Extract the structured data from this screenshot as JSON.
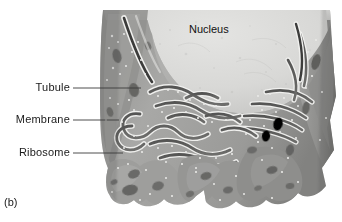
{
  "figure": {
    "caption": "(b)",
    "style": "grayscale textbook illustration"
  },
  "labels": {
    "tubule": "Tubule",
    "membrane": "Membrane",
    "ribosome": "Ribosome",
    "nucleus": "Nucleus"
  },
  "leaders": [
    {
      "name": "tubule-leader",
      "x1": 73,
      "y1": 88,
      "x2": 141,
      "y2": 88
    },
    {
      "name": "membrane-leader",
      "x1": 73,
      "y1": 120,
      "x2": 119,
      "y2": 120
    },
    {
      "name": "ribosome-leader",
      "x1": 73,
      "y1": 153,
      "x2": 123,
      "y2": 153
    }
  ],
  "colors": {
    "background": "#ffffff",
    "nucleus_fill": "#dcdcda",
    "nucleus_shadow": "#c4c4c2",
    "cytoplasm_light": "#b4b4b2",
    "cytoplasm_mid": "#9c9c9a",
    "cytoplasm_dark": "#7e7e7c",
    "cisterna_lumen": "#5f5f5e",
    "cisterna_lumen_dark": "#4a4a49",
    "membrane_highlight": "#f0f0ee",
    "vacuole": "#6c6c6a",
    "ribosome_dot": "#e8e8e6",
    "leader_line": "#3a3a3a",
    "text": "#1a1a1a"
  },
  "geometry": {
    "canvas_width": 342,
    "canvas_height": 222,
    "illustration_left": 103,
    "illustration_top": 8,
    "illustration_right": 332,
    "illustration_bottom": 212
  }
}
